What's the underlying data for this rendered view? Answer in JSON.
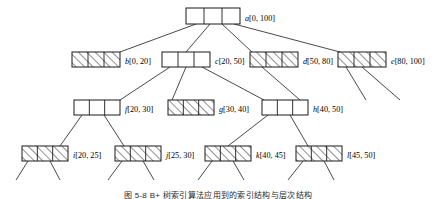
{
  "figure": {
    "caption": "图 5-8   B+ 树索引算法应用到的索引结构与层次结构",
    "colors": {
      "stroke": "#1a1a1a",
      "hatch": "#3a3a3a",
      "fill_empty": "#ffffff",
      "background": "#ffffff"
    },
    "legend": {
      "hatched_meaning": "hatched / filled node",
      "empty_meaning": "empty white node"
    }
  },
  "tree": {
    "levels": [
      {
        "level": 0,
        "nodes": [
          {
            "id": "a",
            "label": "a[0, 100]",
            "letter": "a",
            "interval": "[0, 100]",
            "cells": 3,
            "fill": "empty",
            "x": 186,
            "y": 8,
            "w": 54,
            "h": 16
          }
        ]
      },
      {
        "level": 1,
        "nodes": [
          {
            "id": "b",
            "label": "b[0, 20]",
            "letter": "b",
            "interval": "[0, 20]",
            "cells": 3,
            "fill": "hatched",
            "x": 72,
            "y": 52,
            "w": 48,
            "h": 15
          },
          {
            "id": "c",
            "label": "c[20, 50]",
            "letter": "c",
            "interval": "[20, 50]",
            "cells": 3,
            "fill": "empty",
            "x": 162,
            "y": 52,
            "w": 48,
            "h": 15
          },
          {
            "id": "d",
            "label": "d[50, 80]",
            "letter": "d",
            "interval": "[50, 80]",
            "cells": 3,
            "fill": "hatched",
            "x": 250,
            "y": 52,
            "w": 48,
            "h": 15
          },
          {
            "id": "e",
            "label": "e[80, 100]",
            "letter": "e",
            "interval": "[80, 100]",
            "cells": 3,
            "fill": "hatched",
            "x": 338,
            "y": 52,
            "w": 48,
            "h": 15
          }
        ]
      },
      {
        "level": 2,
        "nodes": [
          {
            "id": "f",
            "label": "f[20, 30]",
            "letter": "f",
            "interval": "[20, 30]",
            "cells": 3,
            "fill": "empty",
            "x": 74,
            "y": 100,
            "w": 46,
            "h": 15
          },
          {
            "id": "g",
            "label": "g[30, 40]",
            "letter": "g",
            "interval": "[30, 40]",
            "cells": 3,
            "fill": "hatched",
            "x": 168,
            "y": 100,
            "w": 46,
            "h": 15
          },
          {
            "id": "h",
            "label": "h[40, 50]",
            "letter": "h",
            "interval": "[40, 50]",
            "cells": 3,
            "fill": "empty",
            "x": 262,
            "y": 100,
            "w": 46,
            "h": 15
          }
        ]
      },
      {
        "level": 3,
        "nodes": [
          {
            "id": "i",
            "label": "i[20, 25]",
            "letter": "i",
            "interval": "[20, 25]",
            "cells": 3,
            "fill": "hatched",
            "x": 22,
            "y": 146,
            "w": 46,
            "h": 15
          },
          {
            "id": "j",
            "label": "j[25, 30]",
            "letter": "j",
            "interval": "[25, 30]",
            "cells": 3,
            "fill": "hatched",
            "x": 115,
            "y": 146,
            "w": 46,
            "h": 15
          },
          {
            "id": "k",
            "label": "k[40, 45]",
            "letter": "k",
            "interval": "[40, 45]",
            "cells": 3,
            "fill": "hatched",
            "x": 205,
            "y": 146,
            "w": 46,
            "h": 15
          },
          {
            "id": "l",
            "label": "l[45, 50]",
            "letter": "l",
            "interval": "[45, 50]",
            "cells": 3,
            "fill": "hatched",
            "x": 296,
            "y": 146,
            "w": 46,
            "h": 15
          }
        ]
      }
    ],
    "edges": [
      {
        "from": "a",
        "to": "b",
        "x1": 196,
        "y1": 24,
        "x2": 120,
        "y2": 52
      },
      {
        "from": "a",
        "to": "c",
        "x1": 210,
        "y1": 24,
        "x2": 186,
        "y2": 52
      },
      {
        "from": "a",
        "to": "d",
        "x1": 222,
        "y1": 24,
        "x2": 252,
        "y2": 52
      },
      {
        "from": "a",
        "to": "e",
        "x1": 234,
        "y1": 24,
        "x2": 340,
        "y2": 52
      },
      {
        "from": "c",
        "to": "f",
        "x1": 170,
        "y1": 67,
        "x2": 120,
        "y2": 100
      },
      {
        "from": "c",
        "to": "g",
        "x1": 186,
        "y1": 67,
        "x2": 172,
        "y2": 100
      },
      {
        "from": "c",
        "to": "h",
        "x1": 202,
        "y1": 67,
        "x2": 264,
        "y2": 100
      },
      {
        "from": "d",
        "to": "d1",
        "x1": 262,
        "y1": 67,
        "x2": 300,
        "y2": 100
      },
      {
        "from": "e",
        "to": "e1",
        "x1": 346,
        "y1": 67,
        "x2": 366,
        "y2": 100
      },
      {
        "from": "e",
        "to": "e2",
        "x1": 362,
        "y1": 67,
        "x2": 400,
        "y2": 100
      },
      {
        "from": "f",
        "to": "i",
        "x1": 82,
        "y1": 115,
        "x2": 60,
        "y2": 146
      },
      {
        "from": "f",
        "to": "j",
        "x1": 104,
        "y1": 115,
        "x2": 124,
        "y2": 146
      },
      {
        "from": "h",
        "to": "k",
        "x1": 268,
        "y1": 115,
        "x2": 228,
        "y2": 146
      },
      {
        "from": "h",
        "to": "l",
        "x1": 290,
        "y1": 115,
        "x2": 308,
        "y2": 146
      },
      {
        "from": "i",
        "to": "i1",
        "x1": 28,
        "y1": 161,
        "x2": 16,
        "y2": 180
      },
      {
        "from": "i",
        "to": "i2",
        "x1": 50,
        "y1": 161,
        "x2": 60,
        "y2": 180
      },
      {
        "from": "j",
        "to": "j1",
        "x1": 122,
        "y1": 161,
        "x2": 108,
        "y2": 180
      },
      {
        "from": "j",
        "to": "j2",
        "x1": 143,
        "y1": 161,
        "x2": 154,
        "y2": 180
      },
      {
        "from": "k",
        "to": "k1",
        "x1": 212,
        "y1": 161,
        "x2": 198,
        "y2": 180
      },
      {
        "from": "k",
        "to": "k2",
        "x1": 233,
        "y1": 161,
        "x2": 244,
        "y2": 180
      },
      {
        "from": "l",
        "to": "l1",
        "x1": 303,
        "y1": 161,
        "x2": 288,
        "y2": 180
      },
      {
        "from": "l",
        "to": "l2",
        "x1": 324,
        "y1": 161,
        "x2": 334,
        "y2": 180
      }
    ]
  }
}
